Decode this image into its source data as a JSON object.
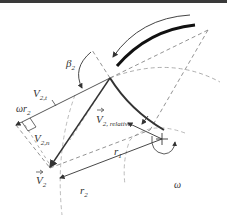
{
  "diagram": {
    "labels": {
      "beta2": "β",
      "beta2_sub": "2",
      "V2t": "V",
      "V2t_sub": "2,t",
      "omega_r2": "ωr",
      "omega_r2_sub": "2",
      "V2n": "V",
      "V2n_sub": "2,n",
      "V2rel": "V",
      "V2rel_sub": "2, relative",
      "V2": "V",
      "V2_sub": "2",
      "r1": "r",
      "r1_sub": "1",
      "r2": "r",
      "r2_sub": "2",
      "omega": "ω"
    },
    "colors": {
      "line": "#333333",
      "dashed": "#888888",
      "light_dashed": "#aaaaaa",
      "blade": "#111111",
      "header": "#3a3a3a"
    }
  }
}
